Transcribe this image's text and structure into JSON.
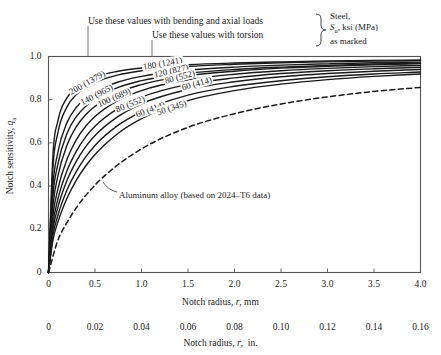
{
  "annotations": {
    "bending": "Use these values with bending and axial loads",
    "torsion": "Use these values with torsion",
    "material_line1": "Steel,",
    "material_line2": "Sᵤ, ksi (MPa)",
    "material_line3": "as marked",
    "aluminum": "Aluminum alloy (based on 2024–T6 data)"
  },
  "axes": {
    "y_label": "Notch sensitivity, q",
    "y_label_sub": "a",
    "y_ticks": [
      "0",
      "0.2",
      "0.4",
      "0.6",
      "0.8",
      "1.0"
    ],
    "x_label_mm": "Notch radius, r, mm",
    "x_label_in": "Notch radius, r,  in.",
    "x_ticks_mm": [
      "0",
      "0.5",
      "1.0",
      "1.5",
      "2.0",
      "2.5",
      "3.0",
      "3.5",
      "4.0"
    ],
    "x_ticks_in": [
      "0",
      "0.02",
      "0.04",
      "0.06",
      "0.08",
      "0.10",
      "0.12",
      "0.14",
      "0.16"
    ]
  },
  "chart_data": {
    "type": "line",
    "title": "",
    "xlabel": "Notch radius, r, mm",
    "ylabel": "Notch sensitivity, q_a",
    "xlim": [
      0,
      4.0
    ],
    "ylim": [
      0,
      1.0
    ],
    "xlim_secondary_in": [
      0,
      0.16
    ],
    "grid": false,
    "legend": "inline-curve-labels",
    "series": [
      {
        "name": "200 (1379)",
        "label": "200 (1379)",
        "load_type": "bending and axial",
        "su_ksi": 200,
        "su_mpa": 1379,
        "style": "solid",
        "x": [
          0,
          0.05,
          0.1,
          0.2,
          0.3,
          0.4,
          0.5,
          0.75,
          1.0,
          1.5,
          2.0,
          2.5,
          3.0,
          3.5,
          4.0
        ],
        "y": [
          0,
          0.56,
          0.7,
          0.81,
          0.855,
          0.885,
          0.905,
          0.932,
          0.947,
          0.962,
          0.97,
          0.975,
          0.979,
          0.982,
          0.984
        ]
      },
      {
        "name": "180 (1241)",
        "label": "180 (1241)",
        "load_type": "bending and axial",
        "su_ksi": 180,
        "su_mpa": 1241,
        "style": "solid",
        "x": [
          0,
          0.05,
          0.1,
          0.2,
          0.3,
          0.4,
          0.5,
          0.75,
          1.0,
          1.5,
          2.0,
          2.5,
          3.0,
          3.5,
          4.0
        ],
        "y": [
          0,
          0.5,
          0.645,
          0.768,
          0.824,
          0.857,
          0.88,
          0.915,
          0.934,
          0.954,
          0.964,
          0.971,
          0.975,
          0.979,
          0.981
        ]
      },
      {
        "name": "140 (965)",
        "label": "140 (965)",
        "load_type": "bending and axial",
        "su_ksi": 140,
        "su_mpa": 965,
        "style": "solid",
        "x": [
          0,
          0.05,
          0.1,
          0.2,
          0.3,
          0.4,
          0.5,
          0.75,
          1.0,
          1.5,
          2.0,
          2.5,
          3.0,
          3.5,
          4.0
        ],
        "y": [
          0,
          0.415,
          0.555,
          0.695,
          0.765,
          0.807,
          0.836,
          0.882,
          0.908,
          0.936,
          0.951,
          0.96,
          0.966,
          0.971,
          0.974
        ]
      },
      {
        "name": "120 (827)",
        "label": "120 (827)",
        "load_type": "torsion",
        "su_ksi": 120,
        "su_mpa": 827,
        "style": "solid",
        "x": [
          0,
          0.05,
          0.1,
          0.2,
          0.3,
          0.4,
          0.5,
          0.75,
          1.0,
          1.5,
          2.0,
          2.5,
          3.0,
          3.5,
          4.0
        ],
        "y": [
          0,
          0.365,
          0.5,
          0.645,
          0.722,
          0.77,
          0.803,
          0.857,
          0.888,
          0.922,
          0.94,
          0.951,
          0.959,
          0.965,
          0.969
        ]
      },
      {
        "name": "100 (689)",
        "label": "100 (689)",
        "load_type": "bending and axial",
        "su_ksi": 100,
        "su_mpa": 689,
        "style": "solid",
        "x": [
          0,
          0.05,
          0.1,
          0.2,
          0.3,
          0.4,
          0.5,
          0.75,
          1.0,
          1.5,
          2.0,
          2.5,
          3.0,
          3.5,
          4.0
        ],
        "y": [
          0,
          0.318,
          0.445,
          0.59,
          0.675,
          0.73,
          0.769,
          0.833,
          0.87,
          0.911,
          0.932,
          0.946,
          0.955,
          0.962,
          0.967
        ]
      },
      {
        "name": "80 (552) bending",
        "label": "80 (552)",
        "load_type": "torsion",
        "su_ksi": 80,
        "su_mpa": 552,
        "style": "solid",
        "x": [
          0,
          0.05,
          0.1,
          0.2,
          0.3,
          0.4,
          0.5,
          0.75,
          1.0,
          1.5,
          2.0,
          2.5,
          3.0,
          3.5,
          4.0
        ],
        "y": [
          0,
          0.27,
          0.385,
          0.525,
          0.615,
          0.677,
          0.722,
          0.797,
          0.842,
          0.892,
          0.918,
          0.934,
          0.945,
          0.953,
          0.959
        ]
      },
      {
        "name": "80 (552) torsion",
        "label": "80 (552)",
        "load_type": "bending and axial",
        "su_ksi": 80,
        "su_mpa": 552,
        "style": "solid",
        "x": [
          0,
          0.05,
          0.1,
          0.2,
          0.3,
          0.4,
          0.5,
          0.75,
          1.0,
          1.5,
          2.0,
          2.5,
          3.0,
          3.5,
          4.0
        ],
        "y": [
          0,
          0.232,
          0.338,
          0.472,
          0.562,
          0.628,
          0.677,
          0.76,
          0.812,
          0.871,
          0.901,
          0.921,
          0.934,
          0.943,
          0.95
        ]
      },
      {
        "name": "60 (414) torsion",
        "label": "60 (414)",
        "load_type": "torsion",
        "su_ksi": 60,
        "su_mpa": 414,
        "style": "solid",
        "x": [
          0,
          0.05,
          0.1,
          0.2,
          0.3,
          0.4,
          0.5,
          0.75,
          1.0,
          1.5,
          2.0,
          2.5,
          3.0,
          3.5,
          4.0
        ],
        "y": [
          0,
          0.205,
          0.3,
          0.428,
          0.516,
          0.583,
          0.634,
          0.723,
          0.781,
          0.848,
          0.883,
          0.906,
          0.921,
          0.932,
          0.94
        ]
      },
      {
        "name": "60 (414) bending",
        "label": "60 (414)",
        "load_type": "bending and axial",
        "su_ksi": 60,
        "su_mpa": 414,
        "style": "solid",
        "x": [
          0,
          0.05,
          0.1,
          0.2,
          0.3,
          0.4,
          0.5,
          0.75,
          1.0,
          1.5,
          2.0,
          2.5,
          3.0,
          3.5,
          4.0
        ],
        "y": [
          0,
          0.178,
          0.263,
          0.383,
          0.468,
          0.535,
          0.588,
          0.682,
          0.745,
          0.821,
          0.862,
          0.888,
          0.906,
          0.919,
          0.928
        ]
      },
      {
        "name": "50 (345)",
        "label": "50 (345)",
        "load_type": "bending and axial",
        "su_ksi": 50,
        "su_mpa": 345,
        "style": "solid",
        "x": [
          0,
          0.05,
          0.1,
          0.2,
          0.3,
          0.4,
          0.5,
          0.75,
          1.0,
          1.5,
          2.0,
          2.5,
          3.0,
          3.5,
          4.0
        ],
        "y": [
          0,
          0.155,
          0.232,
          0.345,
          0.428,
          0.493,
          0.546,
          0.645,
          0.712,
          0.796,
          0.842,
          0.872,
          0.893,
          0.908,
          0.919
        ]
      },
      {
        "name": "Aluminum alloy 2024-T6",
        "label": "Aluminum alloy (based on 2024–T6 data)",
        "load_type": "aluminum",
        "style": "dashed",
        "x": [
          0,
          0.1,
          0.2,
          0.3,
          0.4,
          0.5,
          0.75,
          1.0,
          1.5,
          2.0,
          2.5,
          3.0,
          3.5,
          4.0
        ],
        "y": [
          0,
          0.148,
          0.232,
          0.3,
          0.357,
          0.405,
          0.5,
          0.572,
          0.672,
          0.735,
          0.78,
          0.813,
          0.838,
          0.857
        ]
      }
    ]
  },
  "colors": {
    "curve": "#1a1a1a",
    "axis": "#4a4a4a",
    "background": "#ffffff",
    "text": "#1a1a1a"
  }
}
